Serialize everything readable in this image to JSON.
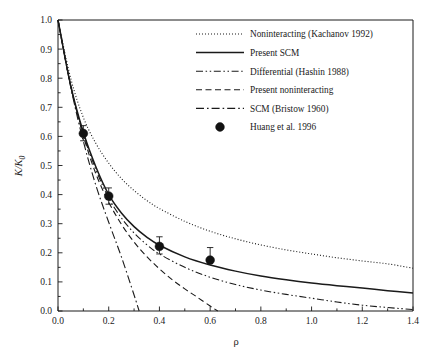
{
  "chart_data": {
    "type": "line",
    "title": "",
    "xlabel": "ρ",
    "ylabel": "K/K",
    "ylabel_sub": "0",
    "xlim": [
      0.0,
      1.4
    ],
    "ylim": [
      0.0,
      1.0
    ],
    "grid": false,
    "legend_position": "top-right",
    "xticks": [
      "0.0",
      "0.2",
      "0.4",
      "0.6",
      "0.8",
      "1.0",
      "1.2",
      "1.4"
    ],
    "xtick_values": [
      0.0,
      0.2,
      0.4,
      0.6,
      0.8,
      1.0,
      1.2,
      1.4
    ],
    "yticks": [
      "0.0",
      "0.1",
      "0.2",
      "0.3",
      "0.4",
      "0.5",
      "0.6",
      "0.7",
      "0.8",
      "0.9",
      "1.0"
    ],
    "ytick_values": [
      0.0,
      0.1,
      0.2,
      0.3,
      0.4,
      0.5,
      0.6,
      0.7,
      0.8,
      0.9,
      1.0
    ],
    "series": [
      {
        "name": "Noninteracting (Kachanov 1992)",
        "style": "dotted",
        "x": [
          0.0,
          0.05,
          0.1,
          0.15,
          0.2,
          0.25,
          0.3,
          0.35,
          0.4,
          0.5,
          0.6,
          0.7,
          0.8,
          0.9,
          1.0,
          1.1,
          1.2,
          1.3,
          1.4
        ],
        "values": [
          1.0,
          0.8,
          0.665,
          0.575,
          0.508,
          0.455,
          0.414,
          0.38,
          0.352,
          0.308,
          0.274,
          0.248,
          0.227,
          0.21,
          0.196,
          0.183,
          0.172,
          0.162,
          0.147
        ]
      },
      {
        "name": "Present SCM",
        "style": "solid",
        "x": [
          0.0,
          0.05,
          0.1,
          0.15,
          0.2,
          0.25,
          0.3,
          0.35,
          0.4,
          0.5,
          0.6,
          0.7,
          0.8,
          0.9,
          1.0,
          1.1,
          1.2,
          1.3,
          1.4
        ],
        "values": [
          1.0,
          0.775,
          0.614,
          0.494,
          0.4,
          0.337,
          0.29,
          0.254,
          0.226,
          0.186,
          0.158,
          0.137,
          0.12,
          0.107,
          0.096,
          0.087,
          0.079,
          0.07,
          0.062
        ]
      },
      {
        "name": "Differential (Hashin 1988)",
        "style": "dashdotdot",
        "x": [
          0.0,
          0.05,
          0.1,
          0.15,
          0.2,
          0.25,
          0.3,
          0.35,
          0.4,
          0.5,
          0.6,
          0.7,
          0.8,
          0.9,
          1.0,
          1.1,
          1.2,
          1.3,
          1.4
        ],
        "values": [
          1.0,
          0.772,
          0.608,
          0.485,
          0.388,
          0.32,
          0.268,
          0.228,
          0.196,
          0.15,
          0.116,
          0.091,
          0.072,
          0.057,
          0.044,
          0.031,
          0.02,
          0.012,
          0.005
        ]
      },
      {
        "name": "Present noninteracting",
        "style": "dashed",
        "x": [
          0.0,
          0.05,
          0.1,
          0.15,
          0.2,
          0.25,
          0.3,
          0.35,
          0.4,
          0.45,
          0.5,
          0.55,
          0.6,
          0.63
        ],
        "values": [
          1.0,
          0.775,
          0.602,
          0.47,
          0.374,
          0.298,
          0.237,
          0.187,
          0.145,
          0.108,
          0.076,
          0.047,
          0.017,
          0.0
        ]
      },
      {
        "name": "SCM (Bristow 1960)",
        "style": "dashdot",
        "x": [
          0.0,
          0.05,
          0.1,
          0.15,
          0.2,
          0.25,
          0.3,
          0.32
        ],
        "values": [
          1.0,
          0.77,
          0.583,
          0.43,
          0.305,
          0.186,
          0.055,
          0.0
        ]
      }
    ],
    "points": {
      "name": "Huang et al. 1996",
      "style": "marker",
      "x": [
        0.1,
        0.2,
        0.4,
        0.6
      ],
      "values": [
        0.61,
        0.395,
        0.222,
        0.175
      ],
      "err_low": [
        0.025,
        0.028,
        0.026,
        0.0
      ],
      "err_high": [
        0.027,
        0.028,
        0.033,
        0.043
      ]
    }
  },
  "legend": {
    "entries": [
      {
        "label": "Noninteracting (Kachanov 1992)"
      },
      {
        "label": "Present SCM"
      },
      {
        "label": "Differential (Hashin 1988)"
      },
      {
        "label": "Present noninteracting"
      },
      {
        "label": "SCM (Bristow 1960)"
      },
      {
        "label": "Huang et al. 1996"
      }
    ]
  },
  "colors": {
    "ink": "#1a1a1a",
    "marker": "#121212",
    "background": "#ffffff"
  }
}
